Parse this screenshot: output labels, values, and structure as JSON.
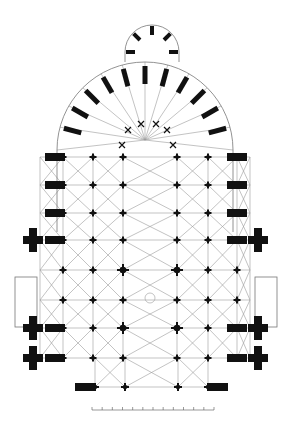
{
  "figure": {
    "type": "architectural floor plan",
    "background": "#ffffff",
    "ink_color": "#111111",
    "vault_line_color": "#9a9a9a"
  },
  "plan": {
    "apse": {
      "cx": 145,
      "cy": 150,
      "r": 88
    },
    "axial_chapel": {
      "cx": 152,
      "cy": 52,
      "r": 27
    },
    "choir_keystones": [
      [
        128,
        130
      ],
      [
        141,
        124
      ],
      [
        156,
        124
      ],
      [
        167,
        130
      ],
      [
        122,
        145
      ],
      [
        173,
        145
      ]
    ],
    "pier_columns_x": [
      63,
      93,
      123,
      177,
      208,
      237
    ],
    "pier_rows_y": [
      157,
      185,
      213,
      240,
      270,
      300,
      328,
      358
    ],
    "outer_buttress_rows_y": [
      157,
      185,
      213,
      240,
      328,
      358
    ],
    "transept": {
      "y_top": 232,
      "y_bottom": 330,
      "x_left": 22,
      "x_right": 268
    },
    "porch_left": {
      "x": 15,
      "y": 277,
      "w": 22,
      "h": 50
    },
    "porch_right": {
      "x": 255,
      "y": 277,
      "w": 22,
      "h": 50
    },
    "west_front_row_y": 387,
    "west_front_columns_x": [
      95,
      125,
      178,
      208
    ],
    "crossing": {
      "cx": 150,
      "cy": 298
    }
  },
  "scale_bar": {
    "x_start": 92,
    "x_end": 214,
    "y": 410,
    "ticks": 12,
    "labels": [
      "",
      "",
      "",
      "",
      "",
      "",
      "",
      "",
      "",
      "",
      "",
      ""
    ]
  }
}
